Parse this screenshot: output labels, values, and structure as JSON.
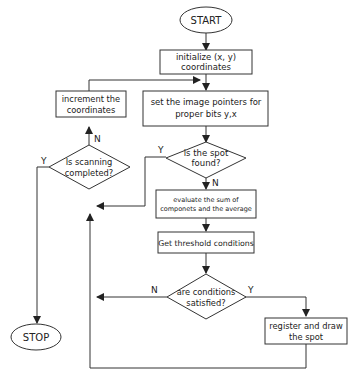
{
  "diagram": {
    "type": "flowchart",
    "nodes": {
      "start": {
        "shape": "terminal",
        "label": "START"
      },
      "init": {
        "shape": "process",
        "lines": [
          "initialize (x, y)",
          "coordinates"
        ]
      },
      "set_pointers": {
        "shape": "process",
        "lines": [
          "set the image pointers for",
          "proper bits y,x"
        ]
      },
      "spot_found": {
        "shape": "decision",
        "lines": [
          "is the spot",
          "found?"
        ]
      },
      "evaluate": {
        "shape": "process",
        "lines": [
          "evaluate the sum of",
          "componets and the average"
        ]
      },
      "threshold": {
        "shape": "process",
        "label": "Get threshold conditions"
      },
      "conditions": {
        "shape": "decision",
        "lines": [
          "are conditions",
          "satisfied?"
        ]
      },
      "register": {
        "shape": "process",
        "lines": [
          "register and draw",
          "the spot"
        ]
      },
      "increment": {
        "shape": "process",
        "lines": [
          "increment the",
          "coordinates"
        ]
      },
      "scanning": {
        "shape": "decision",
        "lines": [
          "Is scanning",
          "completed?"
        ]
      },
      "stop": {
        "shape": "terminal",
        "label": "STOP"
      }
    },
    "edge_labels": {
      "spot_found_yes": "Y",
      "spot_found_no": "N",
      "conditions_yes": "Y",
      "conditions_no": "N",
      "scanning_yes": "Y",
      "scanning_no": "N"
    }
  }
}
